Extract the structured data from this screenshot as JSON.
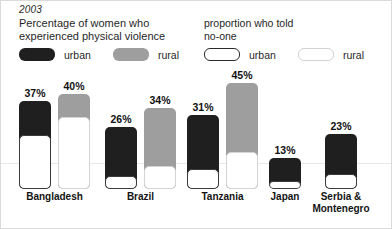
{
  "header": {
    "year": "2003",
    "title_left_line1": "Percentage of women who",
    "title_left_line2": "experienced physical violence",
    "title_right_line1": "proportion who told",
    "title_right_line2": "no-one"
  },
  "legend": {
    "urban_solid": "urban",
    "rural_solid": "rural",
    "urban_hollow": "urban",
    "rural_hollow": "rural"
  },
  "colors": {
    "urban": "#1f1f1f",
    "rural": "#9e9e9e",
    "told_noone_fill": "#ffffff",
    "background": "#ffffff",
    "gridline": "#e8e8e8"
  },
  "chart_data": {
    "type": "bar",
    "title": "Percentage of women who experienced physical violence",
    "subtitle": "proportion who told no-one",
    "year": "2003",
    "xlabel": "",
    "ylabel": "",
    "ylim": [
      0,
      50
    ],
    "grid": true,
    "legend_position": "top",
    "categories": [
      "Bangladesh",
      "Brazil",
      "Tanzania",
      "Japan",
      "Serbia & Montenegro"
    ],
    "series": [
      {
        "name": "urban",
        "values": [
          37,
          26,
          31,
          13,
          23
        ],
        "labels": [
          "37%",
          "26%",
          "31%",
          "13%",
          "23%"
        ]
      },
      {
        "name": "rural",
        "values": [
          40,
          34,
          45,
          null,
          null
        ],
        "labels": [
          "40%",
          "34%",
          "45%",
          "",
          ""
        ]
      }
    ],
    "told_no_one_share": {
      "urban": [
        0.61,
        0.2,
        0.27,
        0.25,
        0.27
      ],
      "rural": [
        0.76,
        0.28,
        0.35,
        null,
        null
      ]
    }
  },
  "bars": [
    {
      "category": "Bangladesh",
      "group_left": 18,
      "urban": {
        "label": "37%",
        "height": 88,
        "offset": 0,
        "noone_height": 54
      },
      "rural": {
        "label": "40%",
        "height": 95,
        "offset": 39,
        "noone_height": 72
      }
    },
    {
      "category": "Brazil",
      "group_left": 104,
      "urban": {
        "label": "26%",
        "height": 62,
        "offset": 0,
        "noone_height": 13
      },
      "rural": {
        "label": "34%",
        "height": 81,
        "offset": 39,
        "noone_height": 23
      }
    },
    {
      "category": "Tanzania",
      "group_left": 186,
      "urban": {
        "label": "31%",
        "height": 74,
        "offset": 0,
        "noone_height": 20
      },
      "rural": {
        "label": "45%",
        "height": 106,
        "offset": 39,
        "noone_height": 37
      }
    },
    {
      "category": "Japan",
      "group_left": 268,
      "urban": {
        "label": "13%",
        "height": 31,
        "offset": 0,
        "noone_height": 8
      },
      "rural": null
    },
    {
      "category": "Serbia & Montenegro",
      "group_left": 324,
      "urban": {
        "label": "23%",
        "height": 55,
        "offset": 0,
        "noone_height": 15
      },
      "rural": null
    }
  ],
  "axis": {
    "gridline_y": 94
  },
  "group_labels": {
    "bangladesh": "Bangladesh",
    "brazil": "Brazil",
    "tanzania": "Tanzania",
    "japan": "Japan",
    "serbia_line1": "Serbia &",
    "serbia_line2": "Montenegro"
  }
}
